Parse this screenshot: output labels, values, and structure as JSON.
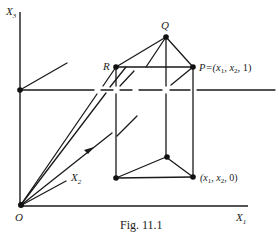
{
  "figure": {
    "caption": "Fig. 11.1",
    "axes": {
      "x1": "X",
      "x1_sub": "1",
      "x2": "X",
      "x2_sub": "2",
      "x3": "X",
      "x3_sub": "3",
      "origin": "O"
    },
    "points": {
      "R": "R",
      "Q": "Q",
      "P_label": "P = (x",
      "P_full": "P=(x₁, x₂, 1)",
      "base_full": "(x₁, x₂, 0)"
    },
    "labels": {
      "P_text": "P=(x",
      "P_sub1": "1",
      "P_mid": ", x",
      "P_sub2": "2",
      "P_end": ", 1)",
      "B_text": "(x",
      "B_sub1": "1",
      "B_mid": ", x",
      "B_sub2": "2",
      "B_end": ", 0)"
    }
  }
}
